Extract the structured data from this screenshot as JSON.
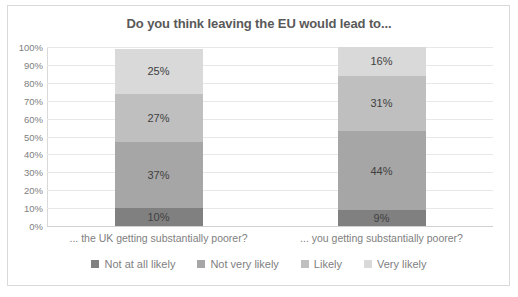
{
  "chart_data": {
    "type": "bar",
    "subtype": "stacked-bar-100-percent",
    "title": "Do you think leaving the EU would lead to...",
    "xlabel": "",
    "ylabel": "",
    "ylim": [
      0,
      100
    ],
    "y_ticks": [
      "0%",
      "10%",
      "20%",
      "30%",
      "40%",
      "50%",
      "60%",
      "70%",
      "80%",
      "90%",
      "100%"
    ],
    "grid": true,
    "legend_position": "bottom",
    "categories": [
      "... the UK getting substantially poorer?",
      "... you getting substantially poorer?"
    ],
    "series": [
      {
        "name": "Not at all likely",
        "values": [
          10,
          9
        ],
        "labels": [
          "10%",
          "9%"
        ],
        "color": "#808080"
      },
      {
        "name": "Not very likely",
        "values": [
          37,
          44
        ],
        "labels": [
          "37%",
          "44%"
        ],
        "color": "#a6a6a6"
      },
      {
        "name": "Likely",
        "values": [
          27,
          31
        ],
        "labels": [
          "27%",
          "31%"
        ],
        "color": "#bfbfbf"
      },
      {
        "name": "Very likely",
        "values": [
          25,
          16
        ],
        "labels": [
          "25%",
          "16%"
        ],
        "color": "#d9d9d9"
      }
    ]
  },
  "colors": {
    "title": "#595959",
    "tick": "#808080",
    "gridline": "#e8e8e8",
    "background": "#ffffff",
    "border": "#d9d9d9"
  }
}
